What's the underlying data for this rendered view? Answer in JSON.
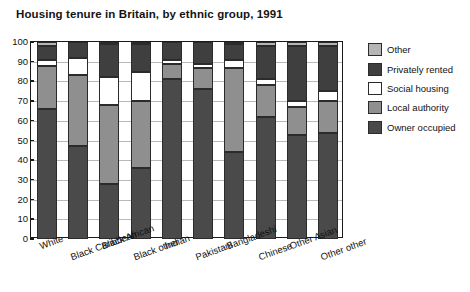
{
  "chart_data": {
    "type": "bar",
    "subtype": "stacked-percentage",
    "title": "Housing tenure in Britain, by ethnic group, 1991",
    "xlabel": "",
    "ylabel": "",
    "ylim": [
      0,
      100
    ],
    "yticks": [
      0,
      10,
      20,
      30,
      40,
      50,
      60,
      70,
      80,
      90,
      100
    ],
    "grid": true,
    "legend_position": "right",
    "categories": [
      "White",
      "Black Caribbean",
      "Black African",
      "Black other",
      "Indian",
      "Pakistani",
      "Bangladeshi",
      "Chinese",
      "Other Asian",
      "Other other"
    ],
    "series": [
      {
        "name": "Owner occupied",
        "color": "#4a4a4a",
        "values": [
          66,
          47,
          28,
          36,
          81,
          76,
          44,
          62,
          53,
          54
        ]
      },
      {
        "name": "Local authority",
        "color": "#8f8f8f",
        "values": [
          22,
          36,
          40,
          34,
          8,
          11,
          43,
          16,
          14,
          16
        ]
      },
      {
        "name": "Social housing",
        "color": "#ffffff",
        "values": [
          3,
          9,
          14,
          15,
          2,
          2,
          4,
          3,
          3,
          5
        ]
      },
      {
        "name": "Privately rented",
        "color": "#3f3f3f",
        "values": [
          7,
          8,
          17,
          14,
          9,
          11,
          8,
          17,
          28,
          23
        ]
      },
      {
        "name": "Other",
        "color": "#b5b5b5",
        "values": [
          2,
          0,
          1,
          1,
          0,
          0,
          1,
          2,
          2,
          2
        ]
      }
    ]
  },
  "legend": {
    "items": [
      {
        "label": "Other",
        "color": "#b5b5b5"
      },
      {
        "label": "Privately rented",
        "color": "#3f3f3f"
      },
      {
        "label": "Social housing",
        "color": "#ffffff"
      },
      {
        "label": "Local authority",
        "color": "#8f8f8f"
      },
      {
        "label": "Owner occupied",
        "color": "#4a4a4a"
      }
    ]
  }
}
